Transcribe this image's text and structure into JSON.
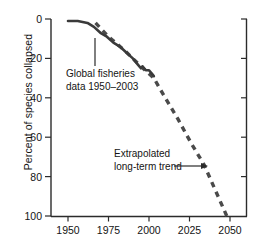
{
  "chart_data": {
    "type": "line",
    "title": "",
    "xlabel": "",
    "ylabel": "Percent of species collapsed",
    "xlim": [
      1947,
      2057
    ],
    "ylim": [
      0,
      100
    ],
    "y_inverted": true,
    "grid": false,
    "legend": "none",
    "xticks": [
      "1950",
      "1975",
      "2000",
      "2025",
      "2050"
    ],
    "xtick_values": [
      1950,
      1975,
      2000,
      2025,
      2050
    ],
    "yticks": [
      "0",
      "20",
      "40",
      "60",
      "80",
      "100"
    ],
    "ytick_values": [
      0,
      20,
      40,
      60,
      80,
      100
    ],
    "series": [
      {
        "name": "Global fisheries data 1950–2003",
        "style": "solid",
        "color": "#3a3a3a",
        "x": [
          1950,
          1956,
          1962,
          1966,
          1970,
          1974,
          1978,
          1982,
          1986,
          1990,
          1993,
          1995,
          1996,
          1998,
          2000,
          2002,
          2003
        ],
        "y": [
          1,
          1,
          2,
          4,
          7,
          9,
          12,
          14,
          17,
          20,
          23,
          25,
          24,
          26,
          26,
          28,
          29
        ]
      },
      {
        "name": "Extrapolated long-term trend",
        "style": "dashed",
        "color": "#4a4a4a",
        "x": [
          1967,
          1975,
          1985,
          1995,
          2003,
          2010,
          2018,
          2026,
          2034,
          2041,
          2048
        ],
        "y": [
          2,
          9,
          16,
          24,
          30,
          40,
          51,
          63,
          74,
          87,
          100
        ]
      }
    ],
    "annotations": [
      {
        "id": "fisheries-annotation",
        "line1": "Global fisheries",
        "line2": "data 1950–2003",
        "leader": "vertical-line-up"
      },
      {
        "id": "extrapolated-annotation",
        "line1": "Extrapolated",
        "line2": "long-term trend",
        "leader": "arrow-right"
      }
    ]
  }
}
